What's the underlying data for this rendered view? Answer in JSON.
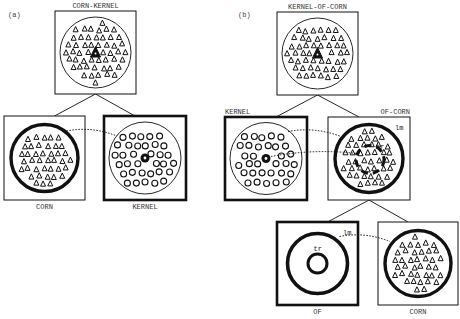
{
  "panels": [
    {
      "id": "a",
      "label": "(a)"
    },
    {
      "id": "b",
      "label": "(b)"
    }
  ],
  "nodes": {
    "a_top": {
      "label": "CORN-KERNEL",
      "content": "triangles",
      "center": "triangle",
      "frame": "thin",
      "outer_ring": "thin"
    },
    "a_left": {
      "label": "CORN",
      "content": "triangles",
      "center": "none",
      "frame": "thin",
      "outer_ring": "thick"
    },
    "a_right": {
      "label": "KERNEL",
      "content": "rings",
      "center": "dot",
      "frame": "thick",
      "outer_ring": "thin"
    },
    "b_top": {
      "label": "KERNEL-OF-CORN",
      "content": "triangles",
      "center": "triangle",
      "frame": "thin",
      "outer_ring": "thin"
    },
    "b_left": {
      "label": "KERNEL",
      "content": "rings",
      "center": "dot",
      "frame": "thick",
      "outer_ring": "thin"
    },
    "b_right": {
      "label": "OF-CORN",
      "content": "triangles",
      "center": "dashed-ring",
      "frame": "thin",
      "outer_ring": "thick",
      "annotations": [
        "lm",
        "tr"
      ]
    },
    "b_of": {
      "label": "OF",
      "content": "empty",
      "center": "ring",
      "frame": "thick",
      "outer_ring": "thick",
      "annotations": [
        "lm",
        "tr"
      ]
    },
    "b_corn": {
      "label": "CORN",
      "content": "triangles",
      "center": "none",
      "frame": "thin",
      "outer_ring": "thick"
    }
  },
  "edges": [
    {
      "from": "a_top",
      "to": "a_left",
      "type": "tree"
    },
    {
      "from": "a_top",
      "to": "a_right",
      "type": "tree"
    },
    {
      "from": "a_left",
      "to": "a_right",
      "type": "dotted-correspondence"
    },
    {
      "from": "b_top",
      "to": "b_left",
      "type": "tree"
    },
    {
      "from": "b_top",
      "to": "b_right",
      "type": "tree"
    },
    {
      "from": "b_left",
      "to": "b_right",
      "type": "dotted-correspondence"
    },
    {
      "from": "b_left",
      "to": "b_right",
      "type": "dotted-correspondence-center"
    },
    {
      "from": "b_right",
      "to": "b_of",
      "type": "tree"
    },
    {
      "from": "b_right",
      "to": "b_corn",
      "type": "tree"
    },
    {
      "from": "b_of",
      "to": "b_corn",
      "type": "dotted-correspondence"
    }
  ],
  "annotation_labels": {
    "lm": "lm",
    "tr": "tr"
  }
}
